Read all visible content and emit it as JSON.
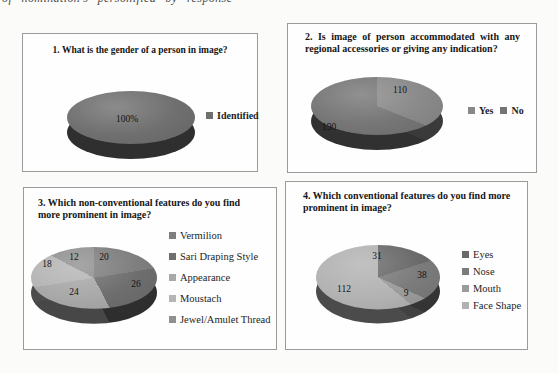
{
  "caption": {
    "visible_fragment": "of nomination's personified by response"
  },
  "chart_data": [
    {
      "type": "pie",
      "pie_3d": true,
      "title": "1. What is the gender of a person in image?",
      "categories": [
        "Identified"
      ],
      "values": [
        100
      ],
      "slice_labels": [
        "100%"
      ],
      "legend": [
        "Identified"
      ],
      "legend_position": "right",
      "colors": [
        "#6f6f6f"
      ]
    },
    {
      "type": "pie",
      "pie_3d": true,
      "title": "2. Is image of person accommodated with any regional accessories or giving any indication?",
      "categories": [
        "Yes",
        "No"
      ],
      "values": [
        110,
        190
      ],
      "slice_labels": [
        "110",
        "190"
      ],
      "legend": [
        "Yes",
        "No"
      ],
      "legend_position": "right",
      "colors": [
        "#898989",
        "#757575"
      ]
    },
    {
      "type": "pie",
      "pie_3d": true,
      "title": "3. Which non-conventional features do you find more prominent in image?",
      "categories": [
        "Vermilion",
        "Sari Draping Style",
        "Appearance",
        "Moustach",
        "Jewel/Amulet Thread"
      ],
      "values": [
        20,
        26,
        24,
        18,
        12
      ],
      "slice_labels": [
        "20",
        "26",
        "24",
        "18",
        "12"
      ],
      "legend": [
        "Vermilion",
        "Sari Draping Style",
        "Appearance",
        "Moustach",
        "Jewel/Amulet Thread"
      ],
      "legend_position": "right",
      "colors": [
        "#7e7e7e",
        "#6e6e6e",
        "#a8a8a8",
        "#b5b5b5",
        "#909090"
      ]
    },
    {
      "type": "pie",
      "pie_3d": true,
      "title": "4. Which conventional features do you find more prominent in image?",
      "categories": [
        "Eyes",
        "Nose",
        "Mouth",
        "Face Shape"
      ],
      "values": [
        31,
        38,
        9,
        112
      ],
      "slice_labels": [
        "31",
        "38",
        "9",
        "112"
      ],
      "legend": [
        "Eyes",
        "Nose",
        "Mouth",
        "Face Shape"
      ],
      "legend_position": "right",
      "colors": [
        "#696969",
        "#7b7b7b",
        "#9b9b9b",
        "#b2b2b2"
      ]
    }
  ]
}
